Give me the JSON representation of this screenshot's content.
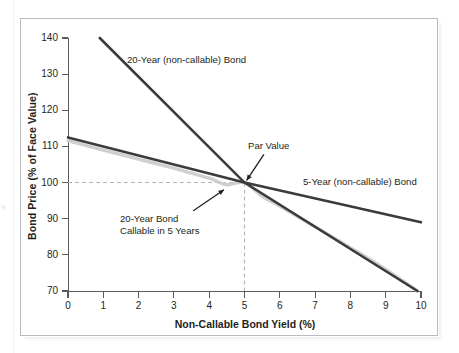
{
  "figure": {
    "margin_page_number": "9"
  },
  "chart_data": {
    "type": "line",
    "title": "",
    "xlabel": "Non-Callable Bond Yield (%)",
    "ylabel": "Bond Price (% of Face Value)",
    "xlim": [
      0,
      10
    ],
    "ylim": [
      70,
      140
    ],
    "xticks": [
      "0",
      "1",
      "2",
      "3",
      "4",
      "5",
      "6",
      "7",
      "8",
      "9",
      "10"
    ],
    "yticks": [
      "140",
      "130",
      "120",
      "110",
      "100",
      "90",
      "80",
      "70"
    ],
    "grid": false,
    "legend_position": "inline-annotations",
    "reference_lines": [
      {
        "name": "par-value-horizontal",
        "axis": "y",
        "value": 100,
        "style": "dashed",
        "color": "#b3b3b3"
      },
      {
        "name": "call-yield-vertical",
        "axis": "x",
        "value": 5,
        "style": "dashed",
        "color": "#b3b3b3"
      }
    ],
    "series": [
      {
        "name": "20-Year (non-callable) Bond",
        "color": "#3b3b3d",
        "style": "solid",
        "x": [
          0.9,
          5.0,
          9.9
        ],
        "y": [
          140.0,
          100.0,
          70.0
        ]
      },
      {
        "name": "5-Year (non-callable) Bond",
        "color": "#3b3b3d",
        "style": "solid",
        "x": [
          0.0,
          5.0,
          10.0
        ],
        "y": [
          112.5,
          100.0,
          89.0
        ]
      },
      {
        "name": "20-Year Bond Callable in 5 Years",
        "color": "#cfcfcf",
        "style": "solid",
        "x": [
          0.0,
          1.0,
          2.0,
          3.0,
          3.5,
          4.0,
          4.5,
          5.0,
          5.5,
          6.0,
          7.0,
          8.0,
          9.0,
          9.9
        ],
        "y": [
          111.6,
          109.0,
          106.5,
          104.0,
          102.6,
          101.2,
          99.4,
          100.0,
          96.2,
          93.5,
          87.8,
          82.0,
          76.0,
          70.0
        ]
      }
    ],
    "annotations": [
      {
        "name": "label-20-year-noncallable",
        "text": "20-Year (non-callable) Bond",
        "x": 1.8,
        "y": 134
      },
      {
        "name": "label-5-year-noncallable",
        "text": "5-Year (non-callable) Bond",
        "x": 6.7,
        "y": 99
      },
      {
        "name": "label-par-value",
        "text": "Par Value",
        "x": 5.2,
        "y": 110,
        "arrow_to": {
          "x": 5.0,
          "y": 100
        }
      },
      {
        "name": "label-20-year-callable",
        "text_line_1": "20-Year Bond",
        "text_line_2": "Callable in 5 Years",
        "x": 1.6,
        "y": 89,
        "arrow_to": {
          "x": 4.7,
          "y": 99
        }
      }
    ]
  }
}
